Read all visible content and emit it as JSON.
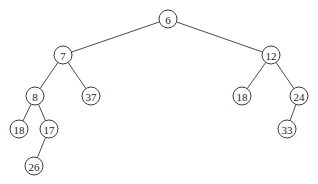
{
  "diagram": {
    "type": "binary-tree",
    "nodes": [
      {
        "id": "n6",
        "label": "6",
        "x": 168,
        "y": 19
      },
      {
        "id": "n7",
        "label": "7",
        "x": 63,
        "y": 55
      },
      {
        "id": "n12",
        "label": "12",
        "x": 271,
        "y": 55
      },
      {
        "id": "n8",
        "label": "8",
        "x": 35,
        "y": 96
      },
      {
        "id": "n37",
        "label": "37",
        "x": 91,
        "y": 96
      },
      {
        "id": "n18b",
        "label": "18",
        "x": 242,
        "y": 96
      },
      {
        "id": "n24",
        "label": "24",
        "x": 299,
        "y": 96
      },
      {
        "id": "n18a",
        "label": "18",
        "x": 19,
        "y": 129
      },
      {
        "id": "n17",
        "label": "17",
        "x": 49,
        "y": 129
      },
      {
        "id": "n33",
        "label": "33",
        "x": 287,
        "y": 129
      },
      {
        "id": "n26",
        "label": "26",
        "x": 34,
        "y": 166
      }
    ],
    "edges": [
      {
        "from": "n6",
        "to": "n7"
      },
      {
        "from": "n6",
        "to": "n12"
      },
      {
        "from": "n7",
        "to": "n8"
      },
      {
        "from": "n7",
        "to": "n37"
      },
      {
        "from": "n12",
        "to": "n18b"
      },
      {
        "from": "n12",
        "to": "n24"
      },
      {
        "from": "n8",
        "to": "n18a"
      },
      {
        "from": "n8",
        "to": "n17"
      },
      {
        "from": "n24",
        "to": "n33"
      },
      {
        "from": "n17",
        "to": "n26"
      }
    ],
    "node_radius": 9,
    "colors": {
      "stroke": "#3a3a3a",
      "edge": "#4a4a4a",
      "text": "#222222",
      "background": "#ffffff"
    }
  }
}
